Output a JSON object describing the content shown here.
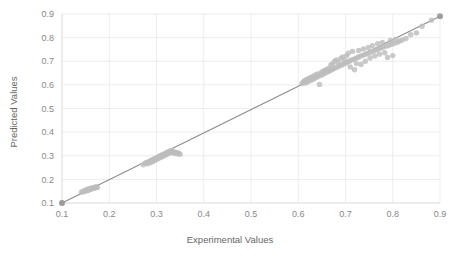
{
  "chart_data": {
    "type": "scatter",
    "title": "",
    "xlabel": "Experimental Values",
    "ylabel": "Predicted Values",
    "xlim": [
      0.1,
      0.9
    ],
    "ylim": [
      0.1,
      0.9
    ],
    "xticks": [
      "0.1",
      "0.2",
      "0.3",
      "0.4",
      "0.5",
      "0.6",
      "0.7",
      "0.8",
      "0.9"
    ],
    "yticks": [
      "0.1",
      "0.2",
      "0.3",
      "0.4",
      "0.5",
      "0.6",
      "0.7",
      "0.8",
      "0.9"
    ],
    "xtick_values": [
      0.1,
      0.2,
      0.3,
      0.4,
      0.5,
      0.6,
      0.7,
      0.8,
      0.9
    ],
    "ytick_values": [
      0.1,
      0.2,
      0.3,
      0.4,
      0.5,
      0.6,
      0.7,
      0.8,
      0.9
    ],
    "grid": true,
    "legend": false,
    "legend_position": "none",
    "point_color": "#bdbdbd",
    "line_color": "#8c8c8c",
    "grid_color": "#e8e8e8",
    "text_color": "#666666",
    "series": [
      {
        "name": "Predicted vs Experimental",
        "marker": "circle",
        "points": [
          [
            0.1,
            0.1
          ],
          [
            0.141,
            0.146
          ],
          [
            0.144,
            0.15
          ],
          [
            0.147,
            0.148
          ],
          [
            0.149,
            0.154
          ],
          [
            0.151,
            0.152
          ],
          [
            0.153,
            0.157
          ],
          [
            0.155,
            0.153
          ],
          [
            0.156,
            0.159
          ],
          [
            0.158,
            0.156
          ],
          [
            0.159,
            0.161
          ],
          [
            0.161,
            0.158
          ],
          [
            0.162,
            0.163
          ],
          [
            0.164,
            0.16
          ],
          [
            0.165,
            0.165
          ],
          [
            0.167,
            0.162
          ],
          [
            0.169,
            0.167
          ],
          [
            0.171,
            0.164
          ],
          [
            0.173,
            0.169
          ],
          [
            0.175,
            0.166
          ],
          [
            0.272,
            0.262
          ],
          [
            0.276,
            0.268
          ],
          [
            0.279,
            0.272
          ],
          [
            0.281,
            0.266
          ],
          [
            0.284,
            0.276
          ],
          [
            0.286,
            0.27
          ],
          [
            0.288,
            0.28
          ],
          [
            0.29,
            0.274
          ],
          [
            0.292,
            0.284
          ],
          [
            0.294,
            0.278
          ],
          [
            0.296,
            0.288
          ],
          [
            0.298,
            0.282
          ],
          [
            0.3,
            0.292
          ],
          [
            0.302,
            0.286
          ],
          [
            0.304,
            0.296
          ],
          [
            0.306,
            0.29
          ],
          [
            0.308,
            0.3
          ],
          [
            0.31,
            0.294
          ],
          [
            0.312,
            0.304
          ],
          [
            0.314,
            0.298
          ],
          [
            0.316,
            0.308
          ],
          [
            0.318,
            0.302
          ],
          [
            0.32,
            0.312
          ],
          [
            0.322,
            0.306
          ],
          [
            0.324,
            0.316
          ],
          [
            0.326,
            0.31
          ],
          [
            0.328,
            0.32
          ],
          [
            0.33,
            0.314
          ],
          [
            0.332,
            0.322
          ],
          [
            0.334,
            0.318
          ],
          [
            0.336,
            0.312
          ],
          [
            0.338,
            0.316
          ],
          [
            0.34,
            0.31
          ],
          [
            0.342,
            0.314
          ],
          [
            0.344,
            0.308
          ],
          [
            0.347,
            0.312
          ],
          [
            0.35,
            0.306
          ],
          [
            0.608,
            0.606
          ],
          [
            0.611,
            0.612
          ],
          [
            0.613,
            0.618
          ],
          [
            0.615,
            0.608
          ],
          [
            0.617,
            0.622
          ],
          [
            0.619,
            0.612
          ],
          [
            0.621,
            0.626
          ],
          [
            0.623,
            0.616
          ],
          [
            0.625,
            0.63
          ],
          [
            0.627,
            0.62
          ],
          [
            0.629,
            0.634
          ],
          [
            0.631,
            0.624
          ],
          [
            0.633,
            0.638
          ],
          [
            0.635,
            0.628
          ],
          [
            0.637,
            0.642
          ],
          [
            0.639,
            0.632
          ],
          [
            0.641,
            0.646
          ],
          [
            0.643,
            0.636
          ],
          [
            0.645,
            0.602
          ],
          [
            0.647,
            0.64
          ],
          [
            0.649,
            0.654
          ],
          [
            0.651,
            0.644
          ],
          [
            0.653,
            0.658
          ],
          [
            0.655,
            0.648
          ],
          [
            0.657,
            0.662
          ],
          [
            0.659,
            0.652
          ],
          [
            0.661,
            0.666
          ],
          [
            0.663,
            0.656
          ],
          [
            0.665,
            0.67
          ],
          [
            0.667,
            0.66
          ],
          [
            0.669,
            0.684
          ],
          [
            0.671,
            0.664
          ],
          [
            0.673,
            0.69
          ],
          [
            0.675,
            0.668
          ],
          [
            0.677,
            0.7
          ],
          [
            0.679,
            0.672
          ],
          [
            0.681,
            0.706
          ],
          [
            0.683,
            0.676
          ],
          [
            0.685,
            0.694
          ],
          [
            0.687,
            0.68
          ],
          [
            0.69,
            0.712
          ],
          [
            0.692,
            0.684
          ],
          [
            0.694,
            0.718
          ],
          [
            0.696,
            0.688
          ],
          [
            0.698,
            0.7
          ],
          [
            0.7,
            0.692
          ],
          [
            0.702,
            0.722
          ],
          [
            0.704,
            0.696
          ],
          [
            0.706,
            0.734
          ],
          [
            0.708,
            0.7
          ],
          [
            0.71,
            0.676
          ],
          [
            0.712,
            0.704
          ],
          [
            0.715,
            0.742
          ],
          [
            0.717,
            0.708
          ],
          [
            0.719,
            0.664
          ],
          [
            0.721,
            0.712
          ],
          [
            0.723,
            0.69
          ],
          [
            0.726,
            0.716
          ],
          [
            0.728,
            0.746
          ],
          [
            0.73,
            0.72
          ],
          [
            0.733,
            0.686
          ],
          [
            0.735,
            0.724
          ],
          [
            0.738,
            0.752
          ],
          [
            0.74,
            0.728
          ],
          [
            0.742,
            0.7
          ],
          [
            0.745,
            0.732
          ],
          [
            0.748,
            0.758
          ],
          [
            0.75,
            0.736
          ],
          [
            0.752,
            0.714
          ],
          [
            0.755,
            0.74
          ],
          [
            0.757,
            0.766
          ],
          [
            0.76,
            0.744
          ],
          [
            0.762,
            0.722
          ],
          [
            0.765,
            0.748
          ],
          [
            0.768,
            0.774
          ],
          [
            0.77,
            0.752
          ],
          [
            0.772,
            0.73
          ],
          [
            0.775,
            0.756
          ],
          [
            0.778,
            0.78
          ],
          [
            0.78,
            0.76
          ],
          [
            0.783,
            0.736
          ],
          [
            0.786,
            0.764
          ],
          [
            0.789,
            0.716
          ],
          [
            0.792,
            0.768
          ],
          [
            0.795,
            0.788
          ],
          [
            0.798,
            0.772
          ],
          [
            0.8,
            0.724
          ],
          [
            0.803,
            0.776
          ],
          [
            0.806,
            0.792
          ],
          [
            0.81,
            0.78
          ],
          [
            0.815,
            0.786
          ],
          [
            0.82,
            0.79
          ],
          [
            0.828,
            0.796
          ],
          [
            0.838,
            0.812
          ],
          [
            0.85,
            0.82
          ],
          [
            0.862,
            0.848
          ],
          [
            0.882,
            0.874
          ]
        ],
        "highlight_points": [
          [
            0.1,
            0.1
          ],
          [
            0.9,
            0.89
          ]
        ]
      }
    ],
    "trend_line": {
      "type": "identity",
      "from": [
        0.1,
        0.1
      ],
      "to": [
        0.9,
        0.89
      ]
    }
  }
}
